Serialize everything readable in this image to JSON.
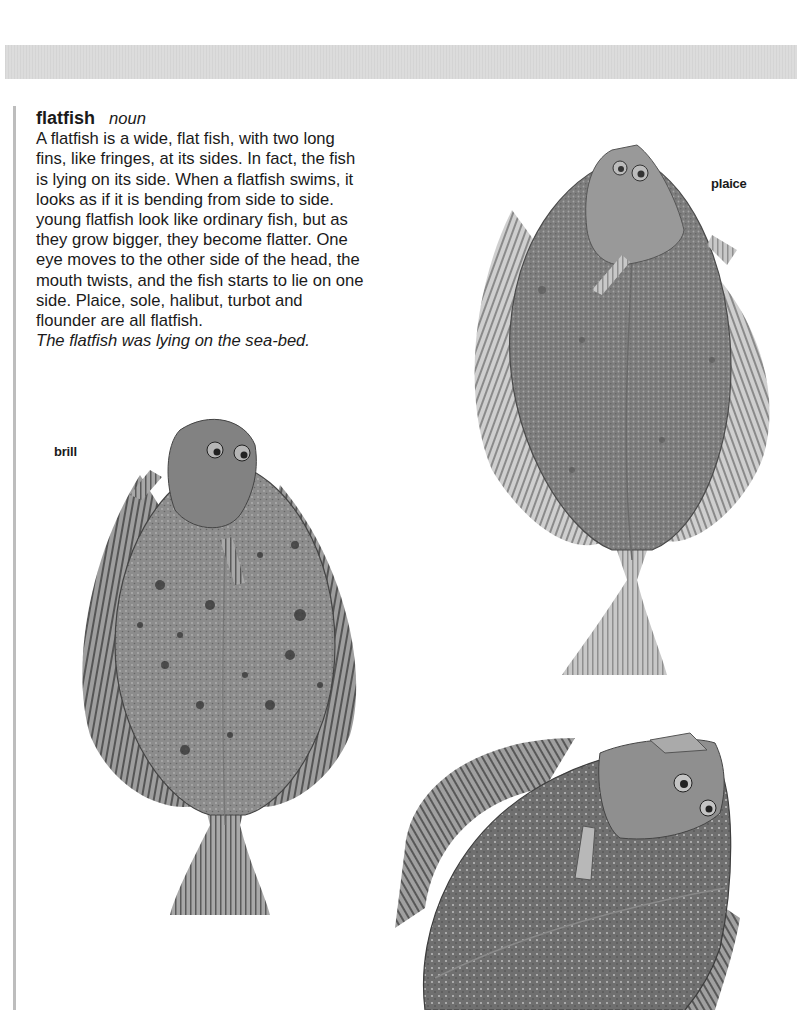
{
  "header_band": {
    "color": "#dcdcdc"
  },
  "entry": {
    "headword": "flatfish",
    "part_of_speech": "noun",
    "definition_lines": [
      "A flatfish is a wide, flat fish, with two long",
      "fins, like fringes, at its sides. In fact, the fish",
      "is lying on its side. When a flatfish swims, it",
      "looks as if it is bending from side to side.",
      "young flatfish look like ordinary fish, but as",
      "they grow bigger, they become flatter. One",
      "eye moves to the other side of the head, the",
      "mouth twists, and the fish starts to lie on one",
      "side. Plaice, sole, halibut, turbot and",
      "flounder are all flatfish."
    ],
    "example": "The flatfish was lying on the sea-bed."
  },
  "illustrations": {
    "plaice": {
      "label": "plaice"
    },
    "brill": {
      "label": "brill"
    },
    "turbot": {
      "label": ""
    }
  }
}
